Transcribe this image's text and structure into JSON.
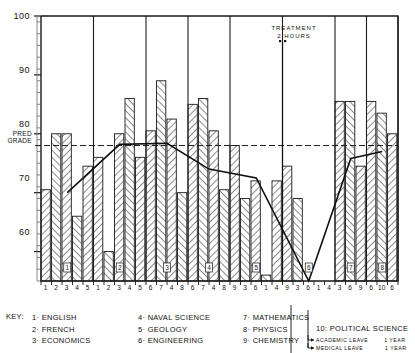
{
  "chart_data": {
    "type": "bar",
    "title": "",
    "xlabel": "",
    "ylabel": "",
    "ylim": [
      55,
      100
    ],
    "yticks": [
      60,
      70,
      80,
      90,
      100
    ],
    "grid": false,
    "pred_grade": 78,
    "pred_grade_label_line1": "PRED",
    "pred_grade_label_line2": "GRADE",
    "annotation": {
      "line1": "TREATMENT",
      "line2": "2 HOURS",
      "x_term": 6
    },
    "terms": [
      {
        "marker": "1",
        "courses": [
          "1",
          "2",
          "3",
          "4",
          "5"
        ],
        "values": [
          70.5,
          80,
          80,
          66,
          74.5
        ]
      },
      {
        "marker": "2",
        "courses": [
          "1",
          "2",
          "3",
          "4",
          "5"
        ],
        "values": [
          76,
          60,
          80,
          86,
          76
        ]
      },
      {
        "marker": "3",
        "courses": [
          "6",
          "7",
          "4",
          "8"
        ],
        "values": [
          80.5,
          89,
          82.5,
          70
        ]
      },
      {
        "marker": "4",
        "courses": [
          "6",
          "7",
          "4",
          "8"
        ],
        "values": [
          85,
          86,
          80.5,
          70.5
        ]
      },
      {
        "marker": "5",
        "courses": [
          "9",
          "3",
          "6",
          "1",
          "4"
        ],
        "values": [
          78,
          69,
          72,
          56,
          72
        ]
      },
      {
        "marker": "6",
        "courses": [
          "9",
          "3",
          "6",
          "1",
          "4"
        ],
        "values": [
          74.5,
          69,
          55,
          55,
          55
        ]
      },
      {
        "marker": "7",
        "courses": [
          "3",
          "6",
          "9"
        ],
        "values": [
          85.5,
          85.5,
          74.5
        ]
      },
      {
        "marker": "8",
        "courses": [
          "6",
          "10",
          "6"
        ],
        "values": [
          85.5,
          83.5,
          80
        ]
      }
    ],
    "trend": {
      "label": "term average",
      "points": [
        {
          "term": 1,
          "value": 70.0
        },
        {
          "term": 2,
          "value": 78.2
        },
        {
          "term": 3,
          "value": 78.4
        },
        {
          "term": 4,
          "value": 74.0
        },
        {
          "term": 5,
          "value": 72.5
        },
        {
          "term": 6,
          "value": 55.0
        },
        {
          "term": 7,
          "value": 75.8
        },
        {
          "term": 8,
          "value": 77.0
        }
      ]
    }
  },
  "legend": {
    "key_label": "KEY:",
    "column1": [
      "1· ENGLISH",
      "2· FRENCH",
      "3· ECONOMICS"
    ],
    "column2": [
      "4· NAVAL  SCIENCE",
      "5· GEOLOGY",
      "6· ENGINEERING"
    ],
    "column3": [
      "7· MATHEMATICS",
      "8· PHYSICS",
      "9· CHEMISTRY"
    ],
    "column4_title": "10: POLITICAL  SCIENCE",
    "leaves": [
      {
        "name": "ACADEMIC  LEAVE",
        "duration": "1    YEAR"
      },
      {
        "name": "MEDICAL  LEAVE",
        "duration": "1    YEAR"
      }
    ]
  },
  "colors": {
    "ink": "#111111",
    "hatch": "#333333",
    "background": "#ffffff"
  }
}
